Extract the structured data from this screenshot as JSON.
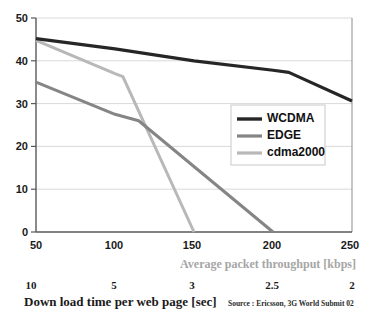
{
  "chart_data": {
    "type": "line",
    "title": "",
    "subtitle": "",
    "xlabel": "Average packet throughput [kbps]",
    "xlabel_secondary": "Down load time per web page [sec]",
    "ylabel": "",
    "xlim": [
      50,
      250
    ],
    "ylim": [
      0,
      50
    ],
    "grid": true,
    "grid_axis": "y",
    "legend_position": "center-right",
    "x_ticks": [
      50,
      100,
      150,
      200,
      250
    ],
    "x_tick_labels": [
      "50",
      "100",
      "150",
      "200",
      "250"
    ],
    "x_ticks_secondary": [
      50,
      100,
      150,
      200,
      250
    ],
    "x_tick_labels_secondary": [
      "10",
      "5",
      "3",
      "2.5",
      "2"
    ],
    "y_ticks": [
      0,
      10,
      20,
      30,
      40,
      50
    ],
    "y_tick_labels": [
      "0",
      "10",
      "20",
      "30",
      "40",
      "50"
    ],
    "series": [
      {
        "name": "WCDMA",
        "color": "#262626",
        "width": 3.2,
        "x": [
          50,
          100,
          150,
          200,
          210,
          250
        ],
        "values": [
          45.2,
          42.8,
          40.0,
          37.8,
          37.3,
          30.6
        ]
      },
      {
        "name": "EDGE",
        "color": "#858585",
        "width": 3.0,
        "x": [
          50,
          100,
          115,
          200
        ],
        "values": [
          35.0,
          27.5,
          26.0,
          0
        ]
      },
      {
        "name": "cdma2000",
        "color": "#b8b8b8",
        "width": 3.0,
        "x": [
          50,
          100,
          105,
          150
        ],
        "values": [
          44.8,
          37.0,
          36.3,
          0
        ]
      }
    ],
    "annotations": [
      {
        "text": "Source : Ericsson, 3G World Submit 02"
      }
    ]
  },
  "legend": {
    "items": [
      {
        "label": "WCDMA"
      },
      {
        "label": "EDGE"
      },
      {
        "label": "cdma2000"
      }
    ]
  },
  "axis_titles": {
    "throughput": "Average packet throughput [kbps]",
    "download_time": "Down load time per web page [sec]"
  },
  "source": "Source : Ericsson, 3G World Submit 02"
}
